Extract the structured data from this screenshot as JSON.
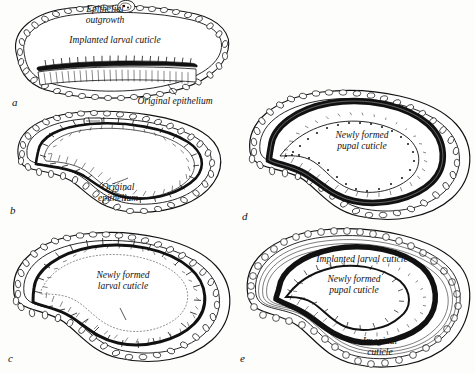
{
  "figure": {
    "title": "",
    "background_color": "#fdfdfb",
    "ink_color": "#111111",
    "panels": [
      {
        "id": "a",
        "letter": "a",
        "labels": [
          {
            "name": "epithelial-outgrowth",
            "text": "Epithelial\noutgrowth"
          },
          {
            "name": "implanted-larval-cuticle",
            "text": "Implanted larval cuticle"
          },
          {
            "name": "original-epithelium",
            "text": "Original epithelium"
          }
        ]
      },
      {
        "id": "b",
        "letter": "b",
        "labels": [
          {
            "name": "original-epithelium",
            "text": "Original\nepithelium"
          }
        ]
      },
      {
        "id": "c",
        "letter": "c",
        "labels": [
          {
            "name": "newly-formed-larval-cuticle",
            "text": "Newly formed\nlarval cuticle"
          }
        ]
      },
      {
        "id": "d",
        "letter": "d",
        "labels": [
          {
            "name": "newly-formed-pupal-cuticle",
            "text": "Newly formed\npupal cuticle"
          }
        ]
      },
      {
        "id": "e",
        "letter": "e",
        "labels": [
          {
            "name": "implanted-larval-cuticle",
            "text": "Implanted larval cuticle"
          },
          {
            "name": "newly-formed-pupal-cuticle",
            "text": "Newly formed\npupal cuticle"
          },
          {
            "name": "imaginal-cuticle",
            "text": "Imaginal\ncuticle"
          }
        ]
      }
    ]
  }
}
